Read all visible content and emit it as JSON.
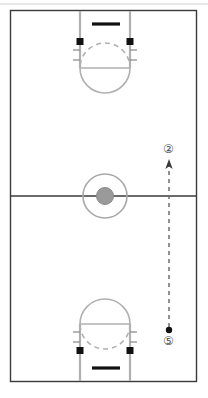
{
  "diagram": {
    "court_color": "#a8a8a8",
    "boundary_color": "#3a3a3a",
    "ink_color": "#1a1a1a",
    "marker_color": "#4a4a4a",
    "background": "#ffffff"
  },
  "court": {
    "boundary": {
      "x": 10,
      "y": 10,
      "width": 187,
      "height": 372
    },
    "top_edge_rule_y": 4,
    "half_court_line_y": 196,
    "center_circle": {
      "cx": 105,
      "cy": 196,
      "r": 22,
      "inner_r": 8,
      "inner_fill": "#9a9a9a"
    },
    "lane_left_x": 80,
    "lane_right_x": 130,
    "keys": [
      {
        "name": "top-key",
        "baseline_y": 10,
        "lane_end_y": 68,
        "hoop_y": 44,
        "circle_cy": 68,
        "circle_r": 25
      },
      {
        "name": "bottom-key",
        "baseline_y": 382,
        "lane_end_y": 324,
        "hoop_y": 348,
        "circle_cy": 324,
        "circle_r": 25
      }
    ],
    "backboards": [
      {
        "name": "top-backboard",
        "x1": 91,
        "x2": 120,
        "y": 24
      },
      {
        "name": "bottom-backboard",
        "x1": 91,
        "x2": 120,
        "y": 368
      }
    ],
    "lane_blocks": [
      {
        "name": "top-left-block",
        "x": 77,
        "y": 38,
        "w": 7,
        "h": 7
      },
      {
        "name": "top-right-block",
        "x": 126,
        "y": 38,
        "w": 7,
        "h": 7
      },
      {
        "name": "bottom-left-block",
        "x": 77,
        "y": 347,
        "w": 7,
        "h": 7
      },
      {
        "name": "bottom-right-block",
        "x": 126,
        "y": 347,
        "w": 7,
        "h": 7
      }
    ]
  },
  "players": [
    {
      "id": "player-2",
      "label": "②",
      "number": 2,
      "x": 169,
      "y": 150,
      "role": "receiver"
    },
    {
      "id": "player-5",
      "label": "⑤",
      "number": 5,
      "x": 169,
      "y": 342,
      "role": "passer"
    }
  ],
  "ball": {
    "name": "ball-marker",
    "x": 169,
    "y": 330,
    "r": 3
  },
  "movement": {
    "name": "pass-line",
    "style": "dashed",
    "from_x": 169,
    "from_y": 328,
    "to_x": 169,
    "to_y": 162,
    "arrowhead": "up"
  }
}
